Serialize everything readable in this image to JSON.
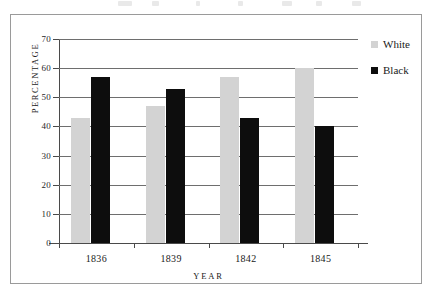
{
  "figure": {
    "background_color": "#ffffff",
    "frame_color": "#9a9a9a"
  },
  "chart_data": {
    "type": "bar",
    "title": "",
    "subtitle": "",
    "xlabel": "YEAR",
    "ylabel": "PERCENTAGE",
    "categories": [
      "1836",
      "1839",
      "1842",
      "1845"
    ],
    "series": [
      {
        "name": "White",
        "color": "#d3d3d3",
        "values": [
          43,
          47,
          57,
          60
        ]
      },
      {
        "name": "Black",
        "color": "#0d0d0d",
        "values": [
          57,
          53,
          43,
          40
        ]
      }
    ],
    "ylim": [
      0,
      70
    ],
    "ytick_step": 10,
    "yticks": [
      "70",
      "60",
      "50",
      "40",
      "30",
      "20",
      "10",
      "0"
    ],
    "ytick_values": [
      70,
      60,
      50,
      40,
      30,
      20,
      10,
      0
    ],
    "grid": true,
    "grid_axis": "y",
    "grid_color": "#6e6e6e",
    "legend_position": "top-right-outside",
    "axis_color": "#4a4a4a",
    "annotations": []
  },
  "legend": {
    "entries": [
      {
        "label": "White",
        "swatch": "white-swatch-icon"
      },
      {
        "label": "Black",
        "swatch": "black-swatch-icon"
      }
    ]
  }
}
